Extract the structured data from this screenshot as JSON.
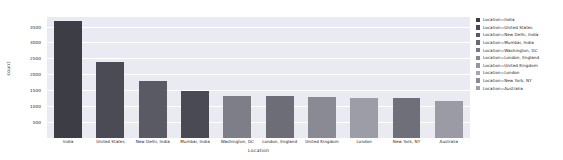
{
  "chart_data": {
    "type": "bar",
    "title": "",
    "xlabel": "Location",
    "ylabel": "count",
    "categories": [
      "India",
      "United States",
      "New Delhi, India",
      "Mumbai, India",
      "Washington, DC",
      "London, England",
      "United Kingdom",
      "London",
      "New York, NY",
      "Australia"
    ],
    "values": [
      3680,
      2380,
      1800,
      1480,
      1330,
      1320,
      1300,
      1270,
      1250,
      1150
    ],
    "ylim": [
      0,
      3800
    ],
    "yticks": [
      500,
      1000,
      1500,
      2000,
      2500,
      3000,
      3500
    ],
    "ytick_labels": [
      "500",
      "1000",
      "1500",
      "2000",
      "2500",
      "3000",
      "3500"
    ],
    "grid": true,
    "legend_position": "right",
    "legend_title": "",
    "legend": [
      {
        "label": "Location=India",
        "color": "#3d3d46"
      },
      {
        "label": "Location=United States",
        "color": "#4b4b55"
      },
      {
        "label": "Location=New Delhi, India",
        "color": "#5a5a64"
      },
      {
        "label": "Location=Mumbai, India",
        "color": "#696973"
      },
      {
        "label": "Location=Washington, DC",
        "color": "#787882"
      },
      {
        "label": "Location=London, England",
        "color": "#878791"
      },
      {
        "label": "Location=United Kingdom",
        "color": "#9696a0"
      },
      {
        "label": "Location=London",
        "color": "#a5a5ae"
      },
      {
        "label": "Location=New York, NY",
        "color": "#8c8c96"
      },
      {
        "label": "Location=Australia",
        "color": "#a0a0aa"
      }
    ],
    "bar_colors": [
      "#3d3d46",
      "#4b4b55",
      "#5a5a64",
      "#4a4a54",
      "#7e7e88",
      "#6d6d77",
      "#8a8a94",
      "#9d9da7",
      "#6f6f79",
      "#9b9ba5"
    ],
    "plot_background": "#eaeaf2",
    "grid_color": "#ffffff"
  }
}
